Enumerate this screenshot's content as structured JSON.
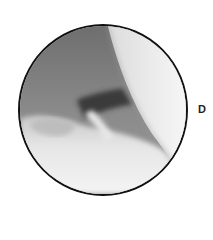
{
  "figure": {
    "panel_label": "D",
    "colors": {
      "border": "#111111",
      "background": "#ffffff"
    }
  }
}
